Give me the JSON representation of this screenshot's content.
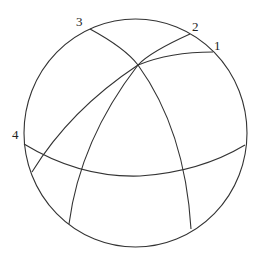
{
  "diagram": {
    "type": "sphere with great-circle arcs",
    "labels": [
      {
        "id": "1",
        "text": "1"
      },
      {
        "id": "2",
        "text": "2"
      },
      {
        "id": "3",
        "text": "3"
      },
      {
        "id": "4",
        "text": "4"
      }
    ],
    "colors": {
      "line": "#333333",
      "background": "#ffffff",
      "text": "#222222"
    }
  }
}
